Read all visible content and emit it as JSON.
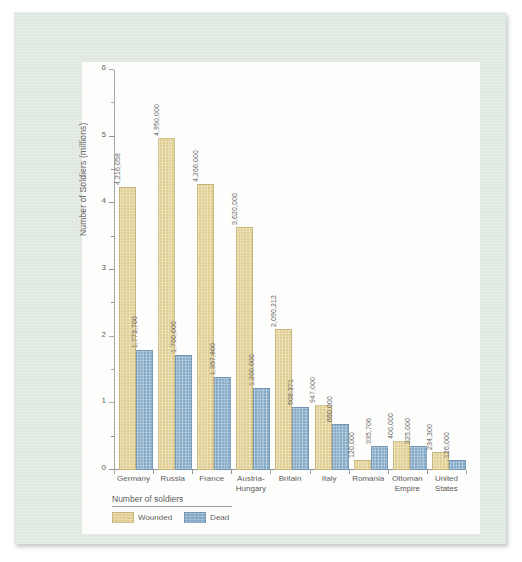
{
  "chart_data": {
    "type": "bar",
    "title": "",
    "xlabel": "",
    "ylabel": "Number of Soldiers (millions)",
    "ylim": [
      0,
      6
    ],
    "ytick_labels": [
      "0",
      "1",
      "2",
      "3",
      "4",
      "5",
      "6"
    ],
    "ytick_values": [
      0,
      1,
      2,
      3,
      4,
      5,
      6
    ],
    "minor_tick_step": 0.5,
    "grid": false,
    "legend_position": "bottom-left",
    "legend_title": "Number of soldiers",
    "categories": [
      "Germany",
      "Russia",
      "France",
      "Austria-Hungary",
      "Britain",
      "Italy",
      "Romania",
      "Ottoman Empire",
      "United States"
    ],
    "series": [
      {
        "name": "Wounded",
        "color": "#e0ce91",
        "values": [
          4216058,
          4950000,
          4266000,
          3620000,
          2090212,
          947000,
          120000,
          400000,
          234300
        ],
        "value_labels": [
          "4,216,058",
          "4,950,000",
          "4,266,000",
          "3,620,000",
          "2,090,212",
          "947,000",
          "120,000",
          "400,000",
          "234,300"
        ]
      },
      {
        "name": "Dead",
        "color": "#83a9c6",
        "values": [
          1773700,
          1700000,
          1357800,
          1200000,
          908371,
          660000,
          335706,
          325000,
          126000
        ],
        "value_labels": [
          "1,773,700",
          "1,700,000",
          "1,357,800",
          "1,200,000",
          "908,371",
          "660,000",
          "335,706",
          "325,000",
          "126,000"
        ]
      }
    ]
  },
  "category_lines": [
    [
      "Germany"
    ],
    [
      "Russia"
    ],
    [
      "France"
    ],
    [
      "Austria-",
      "Hungary"
    ],
    [
      "Britain"
    ],
    [
      "Italy"
    ],
    [
      "Romania"
    ],
    [
      "Ottoman",
      "Empire"
    ],
    [
      "United",
      "States"
    ]
  ],
  "colors": {
    "page_background": "#dfe8e0",
    "card_background": "#fdfdfc",
    "wounded": "#e0ce91",
    "dead": "#83a9c6",
    "axis": "#8f8f8f",
    "text": "#4a4a4a"
  }
}
